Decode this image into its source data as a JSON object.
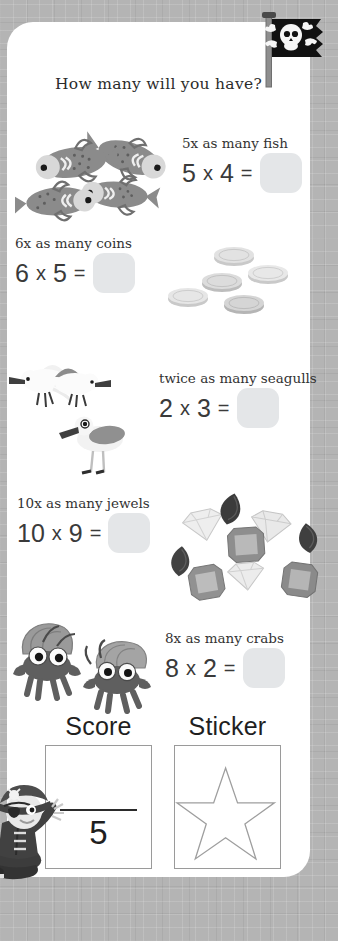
{
  "worksheet": {
    "title": "How many will you have?",
    "theme": "pirate",
    "flag_icon": "pirate-flag-icon",
    "mascot_icon": "pirate-boy-icon",
    "card_color": "#ffffff",
    "background_color": "#b4b4b4",
    "answer_box_color": "#e4e6e8"
  },
  "problems": [
    {
      "id": "fish",
      "prompt": "5x as many fish",
      "multiplier": "5",
      "operator": "x",
      "quantity": "4",
      "equals": "=",
      "equation": "5 x 4 =",
      "answer": "",
      "art_icon": "fish-icon",
      "art_count": 4
    },
    {
      "id": "coins",
      "prompt": "6x as many coins",
      "multiplier": "6",
      "operator": "x",
      "quantity": "5",
      "equals": "=",
      "equation": "6 x 5 =",
      "answer": "",
      "art_icon": "coin-icon",
      "art_count": 5
    },
    {
      "id": "seagulls",
      "prompt": "twice as many seagulls",
      "multiplier": "2",
      "operator": "x",
      "quantity": "3",
      "equals": "=",
      "equation": "2 x 3 =",
      "answer": "",
      "art_icon": "seagull-icon",
      "art_count": 3
    },
    {
      "id": "jewels",
      "prompt": "10x as many jewels",
      "multiplier": "10",
      "operator": "x",
      "quantity": "9",
      "equals": "=",
      "equation": "10 x 9 =",
      "answer": "",
      "art_icon": "jewel-icon",
      "art_count": 9
    },
    {
      "id": "crabs",
      "prompt": "8x as many crabs",
      "multiplier": "8",
      "operator": "x",
      "quantity": "2",
      "equals": "=",
      "equation": "8 x 2 =",
      "answer": "",
      "art_icon": "hermit-crab-icon",
      "art_count": 2
    }
  ],
  "footer": {
    "score_label": "Score",
    "score_value": "",
    "score_total": "5",
    "sticker_label": "Sticker",
    "sticker_icon": "star-icon"
  }
}
